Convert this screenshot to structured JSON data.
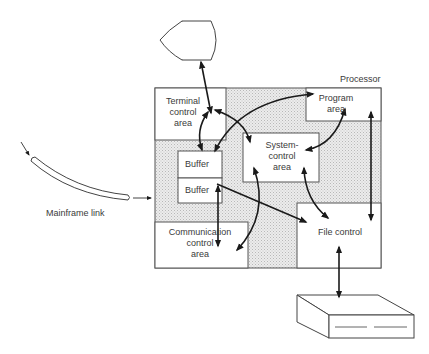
{
  "diagram": {
    "title_label": "Processor",
    "nodes": {
      "terminal": {
        "name": "Terminal (display)"
      },
      "terminal_control": {
        "line1": "Terminal",
        "line2": "control",
        "line3": "area"
      },
      "program_area": {
        "line1": "Program",
        "line2": "area"
      },
      "system_control": {
        "line1": "System-",
        "line2": "control",
        "line3": "area"
      },
      "buffer_top": {
        "label": "Buffer"
      },
      "buffer_bottom": {
        "label": "Buffer"
      },
      "communication_control": {
        "line1": "Communication",
        "line2": "control",
        "line3": "area"
      },
      "file_control": {
        "label": "File control"
      },
      "mainframe_link": {
        "label": "Mainframe link"
      },
      "disk_storage": {
        "name": "Disk storage unit"
      }
    },
    "edges": [
      {
        "from": "terminal",
        "to": "terminal_control",
        "bidirectional": true
      },
      {
        "from": "buffer_top",
        "to": "terminal_control",
        "bidirectional": true
      },
      {
        "from": "terminal_control",
        "to": "system_control",
        "bidirectional": true
      },
      {
        "from": "buffer_top",
        "to": "program_area",
        "bidirectional": true
      },
      {
        "from": "program_area",
        "to": "system_control",
        "bidirectional": true
      },
      {
        "from": "program_area",
        "to": "file_control",
        "bidirectional": true
      },
      {
        "from": "buffer_bottom",
        "to": "communication_control",
        "bidirectional": true
      },
      {
        "from": "buffer_bottom",
        "to": "file_control",
        "bidirectional": false
      },
      {
        "from": "system_control",
        "to": "communication_control",
        "bidirectional": true
      },
      {
        "from": "system_control",
        "to": "file_control",
        "bidirectional": true
      },
      {
        "from": "file_control",
        "to": "disk_storage",
        "bidirectional": true
      },
      {
        "from": "mainframe_link",
        "to": "processor",
        "bidirectional": false
      }
    ],
    "colors": {
      "line": "#1a1a1a",
      "box_border": "#555555",
      "shaded_fill": "#e4e4e4",
      "box_fill": "#ffffff"
    }
  }
}
